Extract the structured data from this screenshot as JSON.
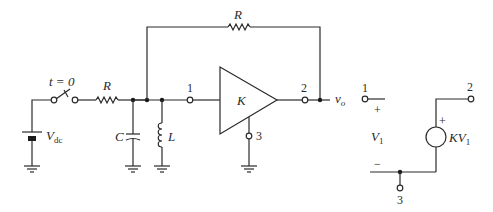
{
  "diagram": {
    "type": "circuit-schematic",
    "left_circuit": {
      "switch_label": "t = 0",
      "source_label": "V",
      "source_subscript": "dc",
      "series_resistor_label": "R",
      "capacitor_label": "C",
      "inductor_label": "L",
      "feedback_resistor_label": "R",
      "amplifier_label": "K",
      "input_terminal": "1",
      "output_terminal": "2",
      "ground_terminal": "3",
      "output_label": "v",
      "output_subscript": "o"
    },
    "model_circuit": {
      "terminal_1": "1",
      "terminal_2": "2",
      "terminal_3": "3",
      "plus_sign": "+",
      "minus_sign": "−",
      "input_voltage_label": "V",
      "input_voltage_subscript": "1",
      "source_plus": "+",
      "dependent_source_label": "KV",
      "dependent_source_subscript": "1"
    },
    "colors": {
      "line": "#2a2a2a",
      "background": "#ffffff"
    }
  }
}
